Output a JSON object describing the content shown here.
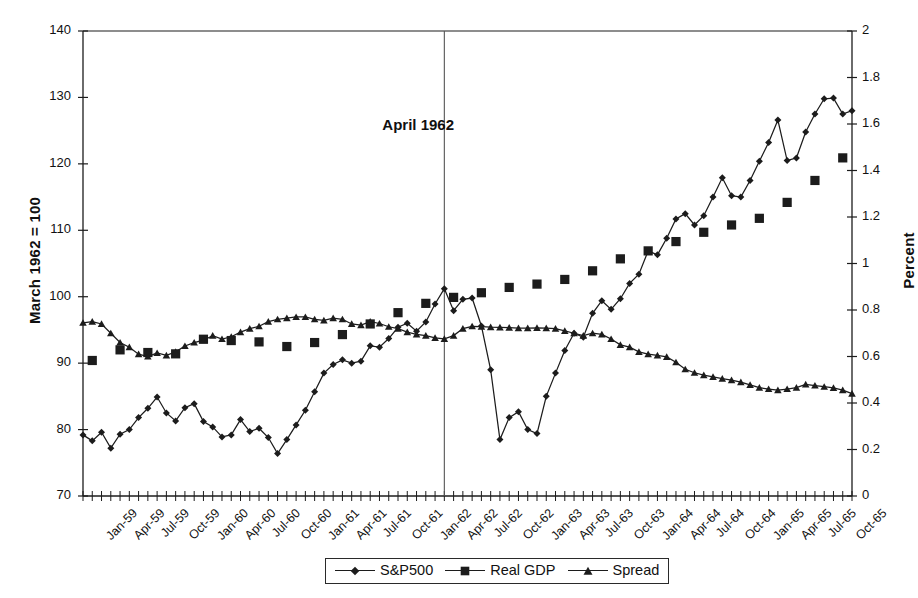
{
  "axes": {
    "left_title": "March 1962 = 100",
    "right_title": "Percent",
    "left_ticks": [
      "70",
      "80",
      "90",
      "100",
      "110",
      "120",
      "130",
      "140"
    ],
    "right_ticks": [
      "0",
      "0.2",
      "0.4",
      "0.6",
      "0.8",
      "1",
      "1.2",
      "1.4",
      "1.6",
      "1.8",
      "2"
    ],
    "left_min": 70,
    "left_max": 140,
    "right_min": 0,
    "right_max": 2
  },
  "annotation": {
    "text": "April 1962",
    "at_label": "Apr-62"
  },
  "legend": {
    "items": [
      {
        "label": "S&P500",
        "marker": "diamond"
      },
      {
        "label": "Real GDP",
        "marker": "square"
      },
      {
        "label": "Spread",
        "marker": "triangle"
      }
    ]
  },
  "chart_data": {
    "type": "line",
    "title": "",
    "xlabel": "",
    "ylabel": "March 1962 = 100",
    "y2label": "Percent",
    "ylim": [
      70,
      140
    ],
    "y2lim": [
      0,
      2
    ],
    "grid": false,
    "legend_position": "bottom",
    "x_tick_labels": [
      "Jan-59",
      "Apr-59",
      "Jul-59",
      "Oct-59",
      "Jan-60",
      "Apr-60",
      "Jul-60",
      "Oct-60",
      "Jan-61",
      "Apr-61",
      "Jul-61",
      "Oct-61",
      "Jan-62",
      "Apr-62",
      "Jul-62",
      "Oct-62",
      "Jan-63",
      "Apr-63",
      "Jul-63",
      "Oct-63",
      "Jan-64",
      "Apr-64",
      "Jul-64",
      "Oct-64",
      "Jan-65",
      "Apr-65",
      "Jul-65",
      "Oct-65"
    ],
    "x_months": [
      "Jan-59",
      "Feb-59",
      "Mar-59",
      "Apr-59",
      "May-59",
      "Jun-59",
      "Jul-59",
      "Aug-59",
      "Sep-59",
      "Oct-59",
      "Nov-59",
      "Dec-59",
      "Jan-60",
      "Feb-60",
      "Mar-60",
      "Apr-60",
      "May-60",
      "Jun-60",
      "Jul-60",
      "Aug-60",
      "Sep-60",
      "Oct-60",
      "Nov-60",
      "Dec-60",
      "Jan-61",
      "Feb-61",
      "Mar-61",
      "Apr-61",
      "May-61",
      "Jun-61",
      "Jul-61",
      "Aug-61",
      "Sep-61",
      "Oct-61",
      "Nov-61",
      "Dec-61",
      "Jan-62",
      "Feb-62",
      "Mar-62",
      "Apr-62",
      "May-62",
      "Jun-62",
      "Jul-62",
      "Aug-62",
      "Sep-62",
      "Oct-62",
      "Nov-62",
      "Dec-62",
      "Jan-63",
      "Feb-63",
      "Mar-63",
      "Apr-63",
      "May-63",
      "Jun-63",
      "Jul-63",
      "Aug-63",
      "Sep-63",
      "Oct-63",
      "Nov-63",
      "Dec-63",
      "Jan-64",
      "Feb-64",
      "Mar-64",
      "Apr-64",
      "May-64",
      "Jun-64",
      "Jul-64",
      "Aug-64",
      "Sep-64",
      "Oct-64",
      "Nov-64",
      "Dec-64",
      "Jan-65",
      "Feb-65",
      "Mar-65",
      "Apr-65",
      "May-65",
      "Jun-65",
      "Jul-65",
      "Aug-65",
      "Sep-65",
      "Oct-65",
      "Nov-65",
      "Dec-65"
    ],
    "series": [
      {
        "name": "S&P500",
        "marker": "diamond",
        "axis": "left",
        "values": [
          79.2,
          78.3,
          79.6,
          77.2,
          79.3,
          80.0,
          81.8,
          83.2,
          84.9,
          82.5,
          81.3,
          83.3,
          83.9,
          81.2,
          80.4,
          78.9,
          79.2,
          81.5,
          79.7,
          80.2,
          78.8,
          76.4,
          78.5,
          80.7,
          82.9,
          85.7,
          88.5,
          89.8,
          90.5,
          90.0,
          90.3,
          92.6,
          92.4,
          93.7,
          95.4,
          96.0,
          94.8,
          96.2,
          98.9,
          101.2,
          97.9,
          99.6,
          99.8,
          95.6,
          89.0,
          78.5,
          81.8,
          82.7,
          80.0,
          79.4,
          85.0,
          88.5,
          91.9,
          94.5,
          93.9,
          97.5,
          99.4,
          98.1,
          99.7,
          102.0,
          103.4,
          106.9,
          106.3,
          108.8,
          111.7,
          112.5,
          110.8,
          112.2,
          115.0,
          117.9,
          115.2,
          115.0,
          117.5,
          120.4,
          123.2,
          126.6,
          120.5,
          120.9,
          124.8,
          127.5,
          129.8,
          129.9,
          127.5,
          128.0
        ]
      },
      {
        "name": "Real GDP",
        "marker": "square",
        "axis": "left",
        "quarterly": true,
        "quarter_labels": [
          "Q1-59",
          "Q2-59",
          "Q3-59",
          "Q4-59",
          "Q1-60",
          "Q2-60",
          "Q3-60",
          "Q4-60",
          "Q1-61",
          "Q2-61",
          "Q3-61",
          "Q4-61",
          "Q1-62",
          "Q2-62",
          "Q3-62",
          "Q4-62",
          "Q1-63",
          "Q2-63",
          "Q3-63",
          "Q4-63",
          "Q1-64",
          "Q2-64",
          "Q3-64",
          "Q4-64",
          "Q1-65",
          "Q2-65",
          "Q3-65",
          "Q4-65"
        ],
        "values": [
          90.4,
          92.0,
          91.6,
          91.4,
          93.6,
          93.4,
          93.2,
          92.5,
          93.1,
          94.3,
          95.9,
          97.6,
          99.0,
          99.9,
          100.6,
          101.4,
          101.9,
          102.6,
          103.9,
          105.7,
          106.9,
          108.3,
          109.7,
          110.8,
          111.8,
          114.2,
          117.5,
          120.9
        ]
      },
      {
        "name": "Spread",
        "marker": "triangle",
        "axis": "right",
        "values": [
          0.745,
          0.75,
          0.74,
          0.7,
          0.66,
          0.64,
          0.61,
          0.6,
          0.615,
          0.605,
          0.62,
          0.645,
          0.66,
          0.67,
          0.69,
          0.675,
          0.685,
          0.705,
          0.72,
          0.73,
          0.75,
          0.76,
          0.765,
          0.77,
          0.77,
          0.76,
          0.755,
          0.765,
          0.76,
          0.74,
          0.735,
          0.75,
          0.742,
          0.728,
          0.72,
          0.705,
          0.695,
          0.69,
          0.68,
          0.676,
          0.69,
          0.72,
          0.73,
          0.728,
          0.726,
          0.725,
          0.724,
          0.722,
          0.722,
          0.723,
          0.722,
          0.72,
          0.71,
          0.7,
          0.69,
          0.7,
          0.695,
          0.675,
          0.65,
          0.64,
          0.62,
          0.61,
          0.605,
          0.598,
          0.575,
          0.545,
          0.53,
          0.52,
          0.512,
          0.505,
          0.498,
          0.49,
          0.478,
          0.466,
          0.46,
          0.455,
          0.46,
          0.466,
          0.48,
          0.475,
          0.47,
          0.465,
          0.455,
          0.44
        ]
      }
    ]
  }
}
